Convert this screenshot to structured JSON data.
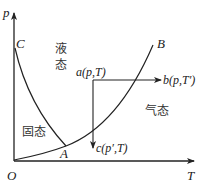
{
  "diagram": {
    "type": "phase-diagram",
    "axes": {
      "y_label": "p",
      "x_label": "T",
      "origin_label": "O"
    },
    "curve_points": {
      "C": "C",
      "A": "A",
      "B": "B"
    },
    "regions": {
      "liquid_line1": "液",
      "liquid_line2": "态",
      "solid": "固态",
      "gas": "气态"
    },
    "states": {
      "a": "a(p,T)",
      "b": "b(p,T′)",
      "c": "c(p′,T)"
    },
    "colors": {
      "line": "#222222",
      "background": "#ffffff"
    }
  }
}
